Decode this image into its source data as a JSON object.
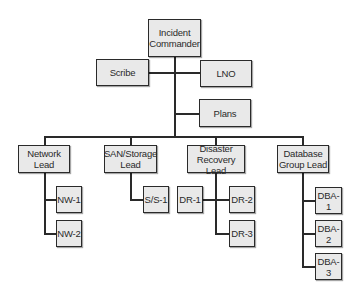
{
  "diagram": {
    "type": "org-chart",
    "title": "",
    "nodes": {
      "incident_commander": "Incident\nCommander",
      "scribe": "Scribe",
      "lno": "LNO",
      "plans": "Plans",
      "network_lead": "Network\nLead",
      "san_storage_lead": "SAN/Storage\nLead",
      "disaster_recovery_lead": "Disaster\nRecovery Lead",
      "database_group_lead": "Database\nGroup Lead",
      "nw1": "NW-1",
      "nw2": "NW-2",
      "ss1": "S/S-1",
      "dr1": "DR-1",
      "dr2": "DR-2",
      "dr3": "DR-3",
      "dba1": "DBA-1",
      "dba2": "DBA-2",
      "dba3": "DBA-3"
    },
    "edges": [
      [
        "Incident Commander",
        "Scribe"
      ],
      [
        "Incident Commander",
        "LNO"
      ],
      [
        "Incident Commander",
        "Plans"
      ],
      [
        "Incident Commander",
        "Network Lead"
      ],
      [
        "Incident Commander",
        "SAN/Storage Lead"
      ],
      [
        "Incident Commander",
        "Disaster Recovery Lead"
      ],
      [
        "Incident Commander",
        "Database Group Lead"
      ],
      [
        "Network Lead",
        "NW-1"
      ],
      [
        "Network Lead",
        "NW-2"
      ],
      [
        "SAN/Storage Lead",
        "S/S-1"
      ],
      [
        "Disaster Recovery Lead",
        "DR-1"
      ],
      [
        "Disaster Recovery Lead",
        "DR-2"
      ],
      [
        "Disaster Recovery Lead",
        "DR-3"
      ],
      [
        "Database Group Lead",
        "DBA-1"
      ],
      [
        "Database Group Lead",
        "DBA-2"
      ],
      [
        "Database Group Lead",
        "DBA-3"
      ]
    ],
    "colors": {
      "box_fill": "#e9e9e9",
      "stroke": "#2a2a2a",
      "background": "#ffffff"
    }
  }
}
